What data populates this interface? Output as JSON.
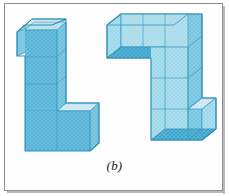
{
  "figure": {
    "caption": "(b)",
    "panel_background": "#ffffff",
    "border_color": "#8e8e90",
    "shadow_color": "#b9b9bb",
    "palette": {
      "top_face": "#c2e3f1",
      "front_face": "#55b4d8",
      "side_face": "#8ed0e6",
      "inner_floor": "#3fa8cf",
      "edge_line": "#4aa9cc",
      "outline": "#2e8fb5"
    },
    "objects": [
      {
        "name": "left-solid",
        "label": "L-shaped stack of unit cubes (left)",
        "cube_count": 6,
        "description": "Vertical column of four cubes with a foot of two cubes at the base extending to the right"
      },
      {
        "name": "right-solid",
        "label": "Z-shaped stack of unit cubes (right)",
        "cube_count": 7,
        "description": "Horizontal arm of three cubes on top, vertical column of three cubes, and a foot cube at the bottom right"
      }
    ]
  }
}
